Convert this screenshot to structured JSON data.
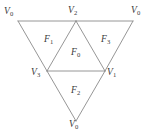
{
  "figure": {
    "name": "tetrahedron-net",
    "type": "geometric-diagram",
    "stroke_color": "#8a8a8a",
    "label_color": "#3a3a3a",
    "background_color": "#ffffff",
    "width": 153,
    "height": 137
  },
  "vertices": [
    {
      "id": "v0-top-left",
      "base": "V",
      "sub": "0",
      "x": 18,
      "y": 21,
      "label_x": 4,
      "label_y": 7
    },
    {
      "id": "v2-top",
      "base": "V",
      "sub": "2",
      "x": 76,
      "y": 21,
      "label_x": 68,
      "label_y": 6
    },
    {
      "id": "v0-top-right",
      "base": "V",
      "sub": "0",
      "x": 133,
      "y": 21,
      "label_x": 131,
      "label_y": 6
    },
    {
      "id": "v3-left",
      "base": "V",
      "sub": "3",
      "x": 47,
      "y": 71,
      "label_x": 31,
      "label_y": 68
    },
    {
      "id": "v1-right",
      "base": "V",
      "sub": "1",
      "x": 105,
      "y": 71,
      "label_x": 107,
      "label_y": 68
    },
    {
      "id": "v0-bottom",
      "base": "V",
      "sub": "0",
      "x": 76,
      "y": 121,
      "label_x": 69,
      "label_y": 120
    }
  ],
  "edges": [
    {
      "id": "edge-top-left-to-v2",
      "x1": 18,
      "y1": 21,
      "x2": 76,
      "y2": 21
    },
    {
      "id": "edge-v2-to-top-right",
      "x1": 76,
      "y1": 21,
      "x2": 133,
      "y2": 21
    },
    {
      "id": "edge-top-left-to-v3",
      "x1": 18,
      "y1": 21,
      "x2": 47,
      "y2": 71
    },
    {
      "id": "edge-v3-to-bottom",
      "x1": 47,
      "y1": 71,
      "x2": 76,
      "y2": 121
    },
    {
      "id": "edge-top-right-to-v1",
      "x1": 133,
      "y1": 21,
      "x2": 105,
      "y2": 71
    },
    {
      "id": "edge-v1-to-bottom",
      "x1": 105,
      "y1": 71,
      "x2": 76,
      "y2": 121
    },
    {
      "id": "edge-v3-to-v1",
      "x1": 47,
      "y1": 71,
      "x2": 105,
      "y2": 71
    },
    {
      "id": "edge-v2-to-v3",
      "x1": 76,
      "y1": 21,
      "x2": 47,
      "y2": 71
    },
    {
      "id": "edge-v2-to-v1",
      "x1": 76,
      "y1": 21,
      "x2": 105,
      "y2": 71
    }
  ],
  "faces": [
    {
      "id": "face-f1",
      "base": "F",
      "sub": "1",
      "label_x": 44,
      "label_y": 35
    },
    {
      "id": "face-f0",
      "base": "F",
      "sub": "0",
      "label_x": 71,
      "label_y": 48
    },
    {
      "id": "face-f3",
      "base": "F",
      "sub": "3",
      "label_x": 101,
      "label_y": 35
    },
    {
      "id": "face-f2",
      "base": "F",
      "sub": "2",
      "label_x": 71,
      "label_y": 86
    }
  ]
}
